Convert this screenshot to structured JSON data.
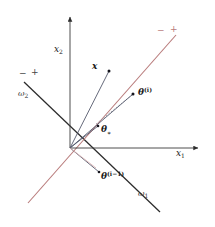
{
  "figure": {
    "background_color": "#ffffff",
    "width": 215,
    "height": 227
  },
  "axes": {
    "x_axis_label": "x",
    "x_axis_subscript": "1",
    "y_axis_label": "x",
    "y_axis_subscript": "2",
    "axis_color": "#3a3a3a",
    "origin": {
      "x": 70,
      "y": 148
    }
  },
  "decision_boundaries": [
    {
      "name": "omega-1",
      "label": "ω",
      "subscript": "1",
      "color": "#2b2b2b",
      "negative_sign": "−",
      "positive_sign": "+",
      "x1": 24,
      "y1": 82,
      "x2": 160,
      "y2": 212
    },
    {
      "name": "omega-2",
      "label": "ω",
      "subscript": "2",
      "color": "#b87a7a",
      "negative_sign": "−",
      "positive_sign": "+",
      "x1": 28,
      "y1": 203,
      "x2": 176,
      "y2": 35
    }
  ],
  "vectors": [
    {
      "name": "x-vector",
      "label": "x",
      "subscript": "",
      "superscript": "",
      "color": "#4a4f63",
      "tip": {
        "x": 109,
        "y": 71
      },
      "label_pos": {
        "x": 92,
        "y": 67
      }
    },
    {
      "name": "theta-star-vector",
      "label": "θ",
      "subscript": "∗",
      "superscript": "",
      "color": "#4a4f63",
      "tip": {
        "x": 98,
        "y": 126
      },
      "label_pos": {
        "x": 101,
        "y": 131
      }
    },
    {
      "name": "theta-i-vector",
      "label": "θ",
      "subscript": "",
      "superscript": "(i)",
      "color": "#4a4f63",
      "tip": {
        "x": 133,
        "y": 94
      },
      "label_pos": {
        "x": 138,
        "y": 94
      }
    },
    {
      "name": "theta-i-minus-1-vector",
      "label": "θ",
      "subscript": "",
      "superscript": "(i−1)",
      "color": "#4a4f63",
      "tip": {
        "x": 99,
        "y": 172
      },
      "label_pos": {
        "x": 101,
        "y": 177
      }
    }
  ],
  "connector": {
    "name": "update-connector",
    "style": "dashed",
    "color": "#8a8a95",
    "from": {
      "x": 96,
      "y": 124
    },
    "to": {
      "x": 132,
      "y": 95
    }
  },
  "sign_markers": {
    "omega1_negative": {
      "text": "−",
      "x": 19,
      "y": 76
    },
    "omega1_positive": {
      "text": "+",
      "x": 31,
      "y": 75
    },
    "omega2_negative": {
      "text": "−",
      "x": 157,
      "y": 33
    },
    "omega2_positive": {
      "text": "+",
      "x": 170,
      "y": 32
    }
  },
  "labels": {
    "omega1_pos": {
      "x": 138,
      "y": 196
    },
    "omega2_pos": {
      "x": 18,
      "y": 96
    },
    "x1_pos": {
      "x": 176,
      "y": 156
    },
    "x2_pos": {
      "x": 54,
      "y": 52
    }
  }
}
